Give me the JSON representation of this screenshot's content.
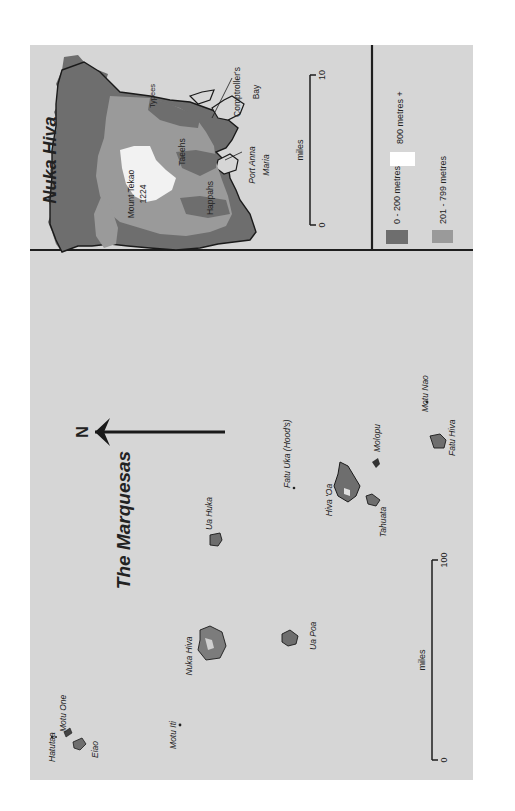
{
  "colors": {
    "page_background": "#ffffff",
    "map_background": "#d6d6d6",
    "frame_line": "#1e1e1e",
    "elevation_low": "#6e6e6e",
    "elevation_mid": "#9a9a9a",
    "elevation_high": "#f2f2f2",
    "coastline": "#1a1a1a",
    "text": "#222222"
  },
  "inset": {
    "title": "Nuka Hiva",
    "labels": {
      "mount": "Mount Tekao",
      "mount_height": "1224",
      "typees": "Typees",
      "taeehs": "Taeehs",
      "happahs": "Happahs",
      "comptrollers_bay_line1": "Comptroller's",
      "comptrollers_bay_line2": "Bay",
      "port_anna_maria_line1": "Port Anna",
      "port_anna_maria_line2": "Maria"
    },
    "scale_bar": {
      "unit": "miles",
      "start": "0",
      "end": "10"
    }
  },
  "legend": {
    "items": [
      {
        "label": "0 - 200 metres",
        "color": "#6e6e6e"
      },
      {
        "label": "201 - 799 metres",
        "color": "#9a9a9a"
      },
      {
        "label": "800 metres +",
        "color": "#ffffff"
      }
    ]
  },
  "overview": {
    "title": "The Marquesas",
    "north_label": "N",
    "islands": [
      {
        "name": "Hatutaa"
      },
      {
        "name": "Motu One"
      },
      {
        "name": "Eiao"
      },
      {
        "name": "Motu Iti"
      },
      {
        "name": "Nuka Hiva"
      },
      {
        "name": "Ua Huka"
      },
      {
        "name": "Ua Poa"
      },
      {
        "name": "Fatu Uka (Hood's)"
      },
      {
        "name": "Hiva 'Oa"
      },
      {
        "name": "Tahuata"
      },
      {
        "name": "Molopu"
      },
      {
        "name": "Motu Nao"
      },
      {
        "name": "Fatu Hiva"
      }
    ],
    "scale_bar": {
      "unit": "miles",
      "start": "0",
      "end": "100"
    }
  }
}
